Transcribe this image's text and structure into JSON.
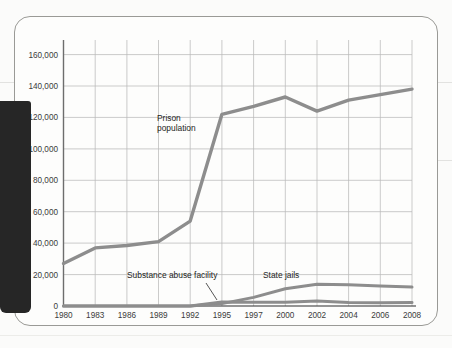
{
  "figure": {
    "border_color": "#9a9a96",
    "page_background": "#fbfbfa",
    "binding_bar_color": "#262626"
  },
  "chart_data": {
    "type": "line",
    "title": "",
    "subtitle": "",
    "xlabel": "",
    "ylabel": "",
    "grid": true,
    "legend_position": "inline-annotations",
    "x": [
      1980,
      1983,
      1986,
      1989,
      1992,
      1995,
      1997,
      2000,
      2002,
      2004,
      2006,
      2008
    ],
    "xtick_labels": [
      "1980",
      "1983",
      "1986",
      "1989",
      "1992",
      "1995",
      "1997",
      "2000",
      "2002",
      "2004",
      "2006",
      "2008"
    ],
    "ytick_labels": [
      "0",
      "20,000",
      "40,000",
      "60,000",
      "80,000",
      "100,000",
      "120,000",
      "140,000",
      "160,000"
    ],
    "yticks": [
      0,
      20000,
      40000,
      60000,
      80000,
      100000,
      120000,
      140000,
      160000
    ],
    "ylim": [
      0,
      168000
    ],
    "series": [
      {
        "name": "Prison population",
        "color": "#8d8d8d",
        "width": 3.4,
        "values": [
          27000,
          37000,
          38500,
          41000,
          54000,
          122000,
          127000,
          133000,
          124000,
          131000,
          134500,
          138000
        ]
      },
      {
        "name": "State jails",
        "color": "#8d8d8d",
        "width": 3.0,
        "values": [
          0,
          0,
          0,
          0,
          0,
          1500,
          5500,
          11000,
          13800,
          13500,
          12800,
          12000
        ]
      },
      {
        "name": "Substance abuse facility",
        "color": "#8d8d8d",
        "width": 3.0,
        "values": [
          0,
          0,
          0,
          0,
          0,
          2600,
          2400,
          2400,
          3200,
          2200,
          2100,
          2200
        ]
      }
    ],
    "annotations": [
      {
        "name": "prison-population",
        "text_line1": "Prison",
        "text_line2": "population"
      },
      {
        "name": "substance-abuse-facility",
        "text": "Substance abuse facility"
      },
      {
        "name": "state-jails",
        "text": "State jails"
      }
    ]
  }
}
